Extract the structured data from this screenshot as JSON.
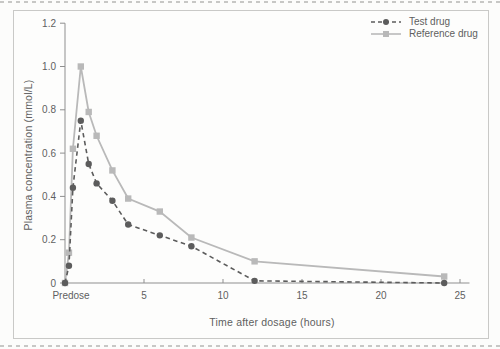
{
  "page": {
    "background": "#fcfcfb",
    "frame_border_color": "#c9c9c7",
    "divider_color": "#c7c7c5"
  },
  "chart_data": {
    "type": "line",
    "title": "",
    "xlabel": "Time after dosage (hours)",
    "ylabel": "Plasma concentration (mmol/L)",
    "x": [
      0,
      0.25,
      0.5,
      1,
      1.5,
      2,
      3,
      4,
      6,
      8,
      12,
      24
    ],
    "x_first_label": "Predose",
    "x_tick_positions": [
      5,
      10,
      15,
      20,
      25
    ],
    "x_tick_labels": [
      "5",
      "10",
      "15",
      "20",
      "25"
    ],
    "y_tick_values": [
      0,
      0.2,
      0.4,
      0.6,
      0.8,
      1.0,
      1.2
    ],
    "y_tick_labels": [
      "0",
      "0.2",
      "0.4",
      "0.6",
      "0.8",
      "1.0",
      "1.2"
    ],
    "xlim": [
      0,
      25.6
    ],
    "ylim": [
      0,
      1.2
    ],
    "grid": false,
    "legend_position": "top-right",
    "axis_color": "#8f8f8f",
    "text_color": "#5f5f5f",
    "series": [
      {
        "name": "Test drug",
        "color": "#5c5c5c",
        "line_style": "dashed",
        "marker": "circle",
        "values": [
          0,
          0.08,
          0.44,
          0.75,
          0.55,
          0.46,
          0.38,
          0.27,
          0.22,
          0.17,
          0.01,
          0
        ]
      },
      {
        "name": "Reference drug",
        "color": "#b9b9b9",
        "line_style": "solid",
        "marker": "square",
        "values": [
          0,
          0.14,
          0.62,
          1.0,
          0.79,
          0.68,
          0.52,
          0.39,
          0.33,
          0.21,
          0.1,
          0.03
        ]
      }
    ]
  }
}
